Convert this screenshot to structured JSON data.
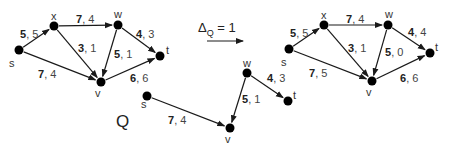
{
  "title_annotation": {
    "delta_symbol": "Δ",
    "delta_subscript": "Q",
    "delta_equals": " = 1",
    "arrow": "right-arrow"
  },
  "graphs": {
    "before": {
      "nodes": [
        {
          "id": "s",
          "label": "s",
          "x": 19,
          "y": 50,
          "lx": 9,
          "ly": 67
        },
        {
          "id": "x",
          "label": "x",
          "x": 54,
          "y": 26,
          "lx": 51,
          "ly": 20
        },
        {
          "id": "w",
          "label": "w",
          "x": 118,
          "y": 25,
          "lx": 114,
          "ly": 18
        },
        {
          "id": "t",
          "label": "t",
          "x": 160,
          "y": 56,
          "lx": 166,
          "ly": 54
        },
        {
          "id": "v",
          "label": "v",
          "x": 101,
          "y": 82,
          "lx": 95,
          "ly": 97
        }
      ],
      "edges": [
        {
          "from": "s",
          "to": "x",
          "cap": "5",
          "flow": "5",
          "lx": 20,
          "ly": 38
        },
        {
          "from": "x",
          "to": "w",
          "cap": "7",
          "flow": "4",
          "lx": 76,
          "ly": 23
        },
        {
          "from": "x",
          "to": "v",
          "cap": "3",
          "flow": "1",
          "lx": 78,
          "ly": 52
        },
        {
          "from": "w",
          "to": "v",
          "cap": "5",
          "flow": "1",
          "lx": 114,
          "ly": 58
        },
        {
          "from": "w",
          "to": "t",
          "cap": "4",
          "flow": "3",
          "lx": 136,
          "ly": 38
        },
        {
          "from": "s",
          "to": "v",
          "cap": "7",
          "flow": "4",
          "lx": 38,
          "ly": 78
        },
        {
          "from": "v",
          "to": "t",
          "cap": "6",
          "flow": "6",
          "lx": 130,
          "ly": 82
        }
      ]
    },
    "after": {
      "nodes": [
        {
          "id": "s",
          "label": "s",
          "x": 289,
          "y": 49,
          "lx": 281,
          "ly": 66
        },
        {
          "id": "x",
          "label": "x",
          "x": 324,
          "y": 25,
          "lx": 321,
          "ly": 19
        },
        {
          "id": "w",
          "label": "w",
          "x": 388,
          "y": 25,
          "lx": 385,
          "ly": 18
        },
        {
          "id": "t",
          "label": "t",
          "x": 430,
          "y": 53,
          "lx": 435,
          "ly": 51
        },
        {
          "id": "v",
          "label": "v",
          "x": 372,
          "y": 81,
          "lx": 366,
          "ly": 96
        }
      ],
      "edges": [
        {
          "from": "s",
          "to": "x",
          "cap": "5",
          "flow": "5",
          "lx": 290,
          "ly": 37
        },
        {
          "from": "x",
          "to": "w",
          "cap": "7",
          "flow": "4",
          "lx": 346,
          "ly": 23
        },
        {
          "from": "x",
          "to": "v",
          "cap": "3",
          "flow": "1",
          "lx": 348,
          "ly": 52
        },
        {
          "from": "w",
          "to": "v",
          "cap": "5",
          "flow": "0",
          "lx": 385,
          "ly": 56
        },
        {
          "from": "w",
          "to": "t",
          "cap": "4",
          "flow": "4",
          "lx": 408,
          "ly": 36
        },
        {
          "from": "s",
          "to": "v",
          "cap": "7",
          "flow": "5",
          "lx": 309,
          "ly": 77
        },
        {
          "from": "v",
          "to": "t",
          "cap": "6",
          "flow": "6",
          "lx": 400,
          "ly": 82
        }
      ]
    },
    "path_q": {
      "label": "Q",
      "label_x": 116,
      "label_y": 127,
      "nodes": [
        {
          "id": "s",
          "label": "s",
          "x": 147,
          "y": 96,
          "lx": 141,
          "ly": 108
        },
        {
          "id": "v",
          "label": "v",
          "x": 230,
          "y": 128,
          "lx": 225,
          "ly": 143
        },
        {
          "id": "w",
          "label": "w",
          "x": 247,
          "y": 73,
          "lx": 243,
          "ly": 67
        },
        {
          "id": "t",
          "label": "t",
          "x": 288,
          "y": 101,
          "lx": 293,
          "ly": 99
        }
      ],
      "edges": [
        {
          "from": "s",
          "to": "v",
          "cap": "7",
          "flow": "4",
          "lx": 168,
          "ly": 124
        },
        {
          "from": "w",
          "to": "v",
          "cap": "5",
          "flow": "1",
          "lx": 242,
          "ly": 103
        },
        {
          "from": "w",
          "to": "t",
          "cap": "4",
          "flow": "3",
          "lx": 267,
          "ly": 82
        }
      ]
    }
  }
}
